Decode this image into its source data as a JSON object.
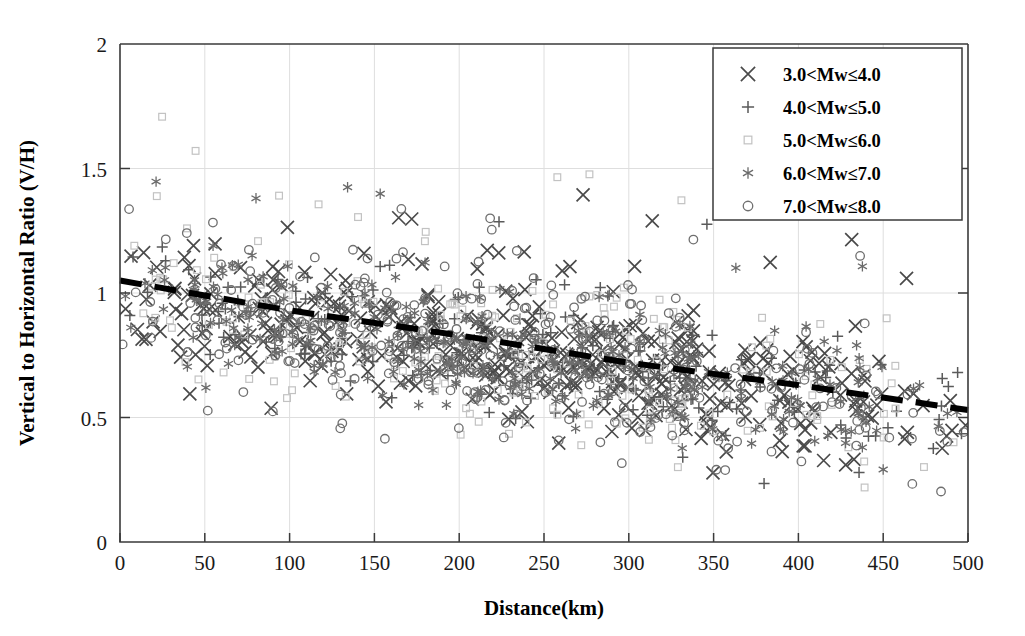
{
  "chart_data": {
    "type": "scatter",
    "title": "",
    "xlabel": "Distance(km)",
    "ylabel": "Vertical to Horizontal Ratio (V/H)",
    "xlim": [
      0,
      500
    ],
    "ylim": [
      0,
      2
    ],
    "xticks": [
      "0",
      "50",
      "100",
      "150",
      "200",
      "250",
      "300",
      "350",
      "400",
      "450",
      "500"
    ],
    "xtick_values": [
      0,
      50,
      100,
      150,
      200,
      250,
      300,
      350,
      400,
      450,
      500
    ],
    "yticks": [
      "0",
      "0.5",
      "1",
      "1.5",
      "2"
    ],
    "ytick_values": [
      0,
      0.5,
      1,
      1.5,
      2
    ],
    "grid": "faint-vertical",
    "legend_position": "top-right",
    "series": [
      {
        "name": "3.0<Mw≤4.0",
        "marker": "cross-icon",
        "color": "#4a4a4a",
        "count": 430
      },
      {
        "name": "4.0<Mw≤5.0",
        "marker": "plus-icon",
        "color": "#5a5a5a",
        "count": 210
      },
      {
        "name": "5.0<Mw≤6.0",
        "marker": "square-icon",
        "color": "#c2c2c2",
        "count": 260
      },
      {
        "name": "6.0<Mw≤7.0",
        "marker": "asterisk-icon",
        "color": "#6a6a6a",
        "count": 300
      },
      {
        "name": "7.0<Mw≤8.0",
        "marker": "circle-icon",
        "color": "#6f6f6f",
        "count": 330
      }
    ],
    "trend_line": {
      "style": "dashed",
      "color": "#000000",
      "points": [
        [
          0,
          1.05
        ],
        [
          100,
          0.93
        ],
        [
          200,
          0.83
        ],
        [
          300,
          0.72
        ],
        [
          400,
          0.63
        ],
        [
          500,
          0.53
        ]
      ],
      "description": "decreasing dashed regression line from about 1.05 at 0 km to about 0.53 at 500 km"
    }
  },
  "legend": {
    "entries": [
      {
        "label": "3.0<Mw≤4.0",
        "marker": "cross-icon"
      },
      {
        "label": "4.0<Mw≤5.0",
        "marker": "plus-icon"
      },
      {
        "label": "5.0<Mw≤6.0",
        "marker": "square-icon"
      },
      {
        "label": "6.0<Mw≤7.0",
        "marker": "asterisk-icon"
      },
      {
        "label": "7.0<Mw≤8.0",
        "marker": "circle-icon"
      }
    ]
  },
  "axes": {
    "x_title": "Distance(km)",
    "y_title": "Vertical to Horizontal Ratio (V/H)"
  }
}
